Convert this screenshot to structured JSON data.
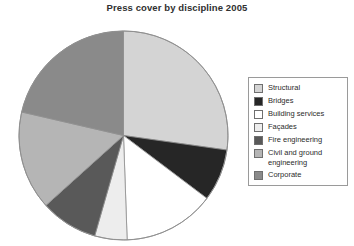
{
  "chart_data": {
    "type": "pie",
    "title": "Press cover by discipline 2005",
    "xlabel": "",
    "ylabel": "",
    "legend_position": "right",
    "grid": false,
    "categories": [
      "Structural",
      "Bridges",
      "Building services",
      "Façades",
      "Fire engineering",
      "Civil and ground engineering",
      "Corporate"
    ],
    "values": [
      27,
      8,
      14,
      5,
      9,
      15,
      22
    ],
    "slices": [
      {
        "label": "Structural",
        "value": 27,
        "color": "#d4d4d4",
        "start_angle": 0,
        "end_angle": 98
      },
      {
        "label": "Bridges",
        "value": 8,
        "color": "#262626",
        "start_angle": 98,
        "end_angle": 127
      },
      {
        "label": "Building services",
        "value": 14,
        "color": "#ffffff",
        "start_angle": 127,
        "end_angle": 178
      },
      {
        "label": "Façades",
        "value": 5,
        "color": "#ededed",
        "start_angle": 178,
        "end_angle": 196
      },
      {
        "label": "Fire engineering",
        "value": 9,
        "color": "#595959",
        "start_angle": 196,
        "end_angle": 228
      },
      {
        "label": "Civil and ground engineering",
        "value": 15,
        "color": "#b5b5b5",
        "start_angle": 228,
        "end_angle": 283
      },
      {
        "label": "Corporate",
        "value": 22,
        "color": "#8a8a8a",
        "start_angle": 283,
        "end_angle": 360
      }
    ]
  },
  "legend": {
    "items": [
      {
        "label": "Structural",
        "color": "#d4d4d4"
      },
      {
        "label": "Bridges",
        "color": "#262626"
      },
      {
        "label": "Building services",
        "color": "#ffffff"
      },
      {
        "label": "Façades",
        "color": "#ededed"
      },
      {
        "label": "Fire engineering",
        "color": "#595959"
      },
      {
        "label": "Civil and ground\nengineering",
        "color": "#b5b5b5"
      },
      {
        "label": "Corporate",
        "color": "#8a8a8a"
      }
    ]
  }
}
